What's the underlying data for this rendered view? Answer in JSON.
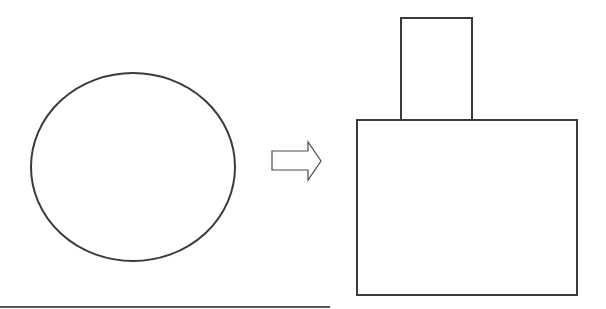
{
  "diagram": {
    "elements": [
      {
        "id": "source-shape",
        "kind": "ellipse",
        "label": ""
      },
      {
        "id": "transform-arrow",
        "kind": "hollow-right-arrow",
        "label": ""
      },
      {
        "id": "result-shape-top",
        "kind": "rectangle",
        "label": ""
      },
      {
        "id": "result-shape-base",
        "kind": "rectangle",
        "label": ""
      }
    ],
    "relations": [
      {
        "from": "source-shape",
        "to": "result-shape",
        "via": "transform-arrow"
      }
    ],
    "colors": {
      "stroke": "#3a3a3a",
      "background": "#ffffff"
    }
  }
}
